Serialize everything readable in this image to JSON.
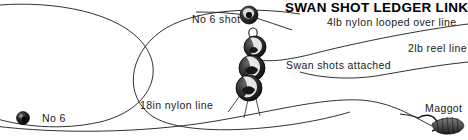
{
  "diagram": {
    "title": "SWAN SHOT LEDGER LINK",
    "canvas": {
      "width": 468,
      "height": 140,
      "background": "#ffffff"
    },
    "ink_color": "#1a1a1a",
    "labels": {
      "no_6_shot": "No 6 shot",
      "nylon_looped": "4lb nylon looped over line",
      "reel_line": "2lb reel line",
      "swan_shots": "Swan shots attached",
      "nylon_18in": "18in nylon line",
      "no_6": "No 6",
      "maggot": "Maggot"
    },
    "components": [
      {
        "name": "swan-shot-1",
        "label": "Swan shot"
      },
      {
        "name": "swan-shot-2",
        "label": "Swan shot"
      },
      {
        "name": "swan-shot-3",
        "label": "Swan shot"
      },
      {
        "name": "no-6-shot-upper",
        "label": "No 6 shot"
      },
      {
        "name": "no-6-shot-lower",
        "label": "No 6"
      },
      {
        "name": "maggot-bait",
        "label": "Maggot"
      },
      {
        "name": "loop-ring",
        "label": "Nylon loop"
      }
    ]
  }
}
